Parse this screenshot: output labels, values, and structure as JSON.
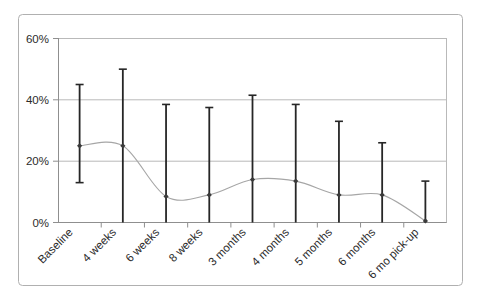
{
  "chart_data": {
    "type": "line",
    "title": "",
    "subtitle": "",
    "xlabel": "",
    "ylabel": "",
    "categories": [
      "Baseline",
      "4 weeks",
      "6 weeks",
      "8 weeks",
      "3 months",
      "4 months",
      "5 months",
      "6 months",
      "6 mo pick-up"
    ],
    "values": [
      25,
      25,
      8.5,
      9,
      14,
      13.5,
      9,
      9,
      0.5
    ],
    "error_upper": [
      45,
      50,
      38.5,
      37.5,
      41.5,
      38.5,
      33,
      26,
      13.5
    ],
    "error_lower": [
      13,
      0,
      0,
      0,
      0,
      0,
      0,
      0,
      0
    ],
    "ylim": [
      0,
      60
    ],
    "yticks": [
      0,
      20,
      40,
      60
    ],
    "ytick_labels": [
      "0%",
      "20%",
      "40%",
      "60%"
    ],
    "grid": true,
    "legend": "none",
    "series": [
      {
        "name": "percent",
        "values": [
          25,
          25,
          8.5,
          9,
          14,
          13.5,
          9,
          9,
          0.5
        ]
      }
    ],
    "marker": "diamond",
    "line_style": "smooth",
    "colors": {
      "line": "#a6a6a6",
      "marker": "#3a3a3a",
      "error_bar": "#262626",
      "grid": "#b9b9b9",
      "axis": "#8f8f8f",
      "frame": "#b0b0b0",
      "text": "#2b2b2b",
      "background": "#ffffff"
    }
  }
}
